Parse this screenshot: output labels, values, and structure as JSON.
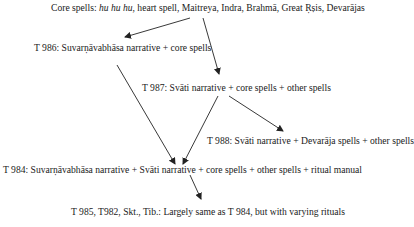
{
  "nodes": {
    "core": {
      "prefix": "Core spells: ",
      "italic": "hu hu hu",
      "suffix": ", heart spell, Maitreya, Indra, Brahmā, Great Ṛṣis, Devarājas"
    },
    "t986": {
      "label": "T 986: Suvarṇāvabhāsa narrative + core spells"
    },
    "t987": {
      "label": "T 987: Svāti narrative + core spells + other spells"
    },
    "t988": {
      "label": "T 988: Svāti narrative + Devarāja spells + other spells"
    },
    "t984": {
      "label": "T 984: Suvarṇāvabhāsa narrative + Svāti narrative + core spells + other spells + ritual manual"
    },
    "t985": {
      "label": "T 985, T982, Skt., Tib.: Largely same as T 984, but with varying rituals"
    }
  },
  "edges": [
    {
      "from": "core",
      "to": "t986"
    },
    {
      "from": "core",
      "to": "t987"
    },
    {
      "from": "t986",
      "to": "t984"
    },
    {
      "from": "t987",
      "to": "t984"
    },
    {
      "from": "t987",
      "to": "t988"
    },
    {
      "from": "t984",
      "to": "t985"
    }
  ],
  "colors": {
    "text": "#1a1a1a",
    "arrow": "#222222",
    "background": "#ffffff"
  }
}
